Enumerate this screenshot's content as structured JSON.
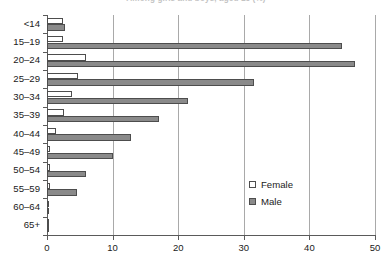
{
  "chart_data": {
    "type": "bar",
    "orientation": "horizontal",
    "title": "Among girls and boys, aged 15 (%)",
    "xlabel": "",
    "ylabel": "",
    "xlim": [
      0,
      50
    ],
    "xticks": [
      0,
      10,
      20,
      30,
      40,
      50
    ],
    "grid": "vertical",
    "legend_position": "inside-right",
    "categories": [
      "<14",
      "15–19",
      "20–24",
      "25–29",
      "30–34",
      "35–39",
      "40–44",
      "45–49",
      "50–54",
      "55–59",
      "60–64",
      "65+"
    ],
    "series": [
      {
        "name": "Female",
        "color": "#ffffff",
        "values": [
          2.5,
          2.5,
          6.0,
          4.7,
          3.8,
          2.6,
          1.4,
          0.4,
          0.4,
          0.4,
          0.3,
          0.3
        ]
      },
      {
        "name": "Male",
        "color": "#8a8a8a",
        "values": [
          2.7,
          45.0,
          47.0,
          31.5,
          21.5,
          17.0,
          12.8,
          10.0,
          6.0,
          4.5,
          0.3,
          0.3
        ]
      }
    ]
  },
  "legend": {
    "entries": [
      {
        "label": "Female",
        "swatch": "hollow-square-icon"
      },
      {
        "label": "Male",
        "swatch": "filled-square-icon"
      }
    ]
  },
  "colors": {
    "male_bar": "#8a8a8a",
    "female_bar": "#ffffff",
    "bar_outline": "#4d4d4d",
    "axis": "#5a5a5a",
    "gridline": "#a9a9a9",
    "text": "#1a1a1a"
  }
}
